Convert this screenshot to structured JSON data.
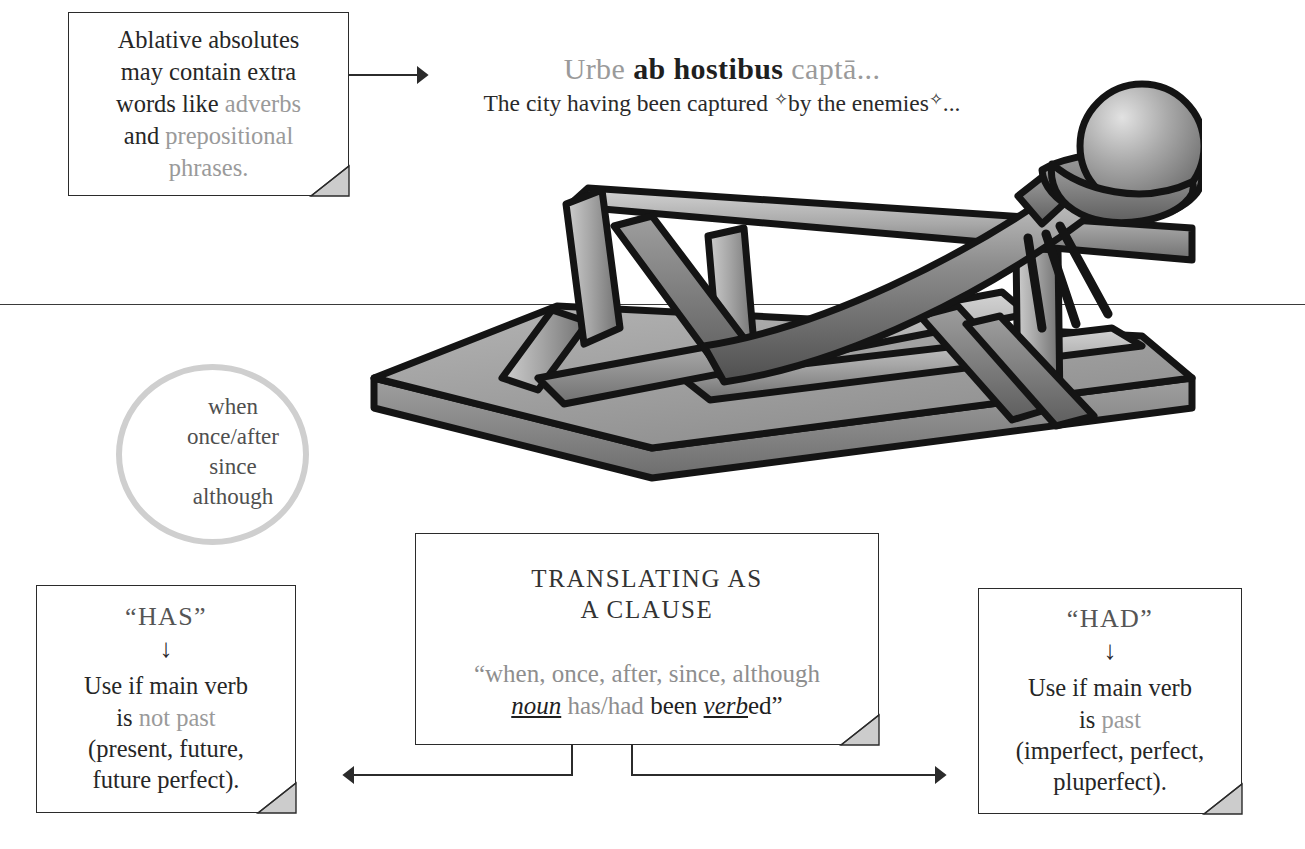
{
  "example": {
    "latin": {
      "w1": "Urbe",
      "w2": "ab hostibus",
      "w3": "captā..."
    },
    "english": {
      "p1": "The city having been captured ",
      "mark1": "✧",
      "p2": "by the enemies",
      "mark2": "✧",
      "p3": "..."
    }
  },
  "note_extra": {
    "t1": "Ablative absolutes",
    "t2": "may contain extra",
    "t3": "words like ",
    "t4": "adverbs",
    "t5": "and ",
    "t6": "prepositional",
    "t7": "phrases."
  },
  "circle": {
    "l1": "when",
    "l2": "once/after",
    "l3": "since",
    "l4": "although"
  },
  "clause_box": {
    "title_l1": "TRANSLATING AS",
    "title_l2": "A CLAUSE",
    "open_quote": "“",
    "conjunctions": "when, once, after, since, although",
    "noun": "noun",
    "haves": " has/had ",
    "been": "been ",
    "verb": "verb",
    "ed": "ed",
    "close_quote": "”"
  },
  "has_box": {
    "title": "“HAS”",
    "arrow": "↓",
    "l1": "Use if main verb",
    "l2_pre": "is ",
    "l2_em": "not past",
    "l3": "(present, future,",
    "l4": "future perfect)."
  },
  "had_box": {
    "title": "“HAD”",
    "arrow": "↓",
    "l1": "Use if main verb",
    "l2_pre": "is ",
    "l2_em": "past",
    "l3": "(imperfect, perfect,",
    "l4": "pluperfect)."
  },
  "colors": {
    "ink": "#262626",
    "gray_text": "#9a9a9a",
    "circle_ring": "#cfcfcf",
    "box_border": "#2b2b2b",
    "catapult_outline": "#141414",
    "catapult_light": "#d8d8d8",
    "catapult_mid": "#9d9d9d",
    "catapult_dark": "#6a6a6a"
  }
}
